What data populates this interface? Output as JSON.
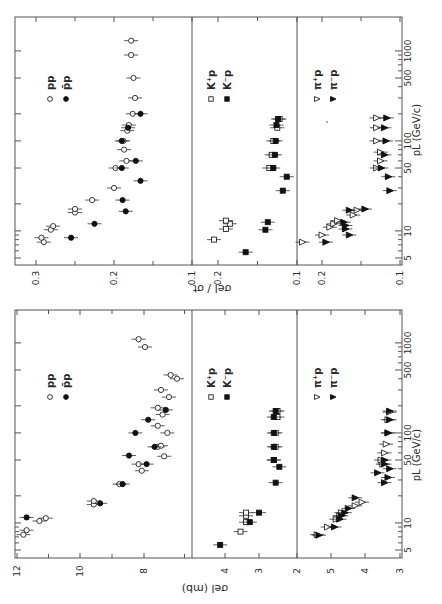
{
  "figure": {
    "orientation": "rotated 90 degrees counter-clockwise",
    "x_axis_label": "p_L (GeV/c)",
    "ticks_pL": [
      5,
      10,
      50,
      100,
      500,
      1000
    ]
  },
  "chart_data": [
    {
      "type": "scatter",
      "title": "Elastic cross section vs beam momentum",
      "xlabel": "p_L (GeV/c)",
      "ylabel": "σ_el (mb)",
      "xscale": "log",
      "xlim": [
        4.5,
        2000
      ],
      "panels": [
        {
          "name": "pp",
          "ylim": [
            6.5,
            12
          ],
          "yticks": [
            8,
            10,
            12
          ],
          "series": [
            {
              "name": "pp",
              "marker": "open-circle",
              "points": [
                [
                  7.4,
                  11.8
                ],
                [
                  8.3,
                  11.7
                ],
                [
                  10.5,
                  11.3
                ],
                [
                  11.3,
                  11.1
                ],
                [
                  16,
                  9.6
                ],
                [
                  17.5,
                  9.6
                ],
                [
                  27,
                  8.8
                ],
                [
                  38,
                  8.1
                ],
                [
                  45,
                  8.2
                ],
                [
                  55,
                  7.4
                ],
                [
                  70,
                  7.6
                ],
                [
                  72,
                  7.5
                ],
                [
                  100,
                  7.3
                ],
                [
                  120,
                  7.6
                ],
                [
                  160,
                  7.45
                ],
                [
                  190,
                  7.6
                ],
                [
                  250,
                  7.25
                ],
                [
                  300,
                  7.5
                ],
                [
                  400,
                  7.0
                ],
                [
                  440,
                  7.2
                ],
                [
                  900,
                  8.0
                ],
                [
                  1100,
                  8.2
                ]
              ]
            },
            {
              "name": "p̄p",
              "marker": "filled-circle",
              "points": [
                [
                  11.5,
                  11.7
                ],
                [
                  16.5,
                  9.4
                ],
                [
                  27,
                  8.7
                ],
                [
                  45,
                  7.95
                ],
                [
                  56,
                  8.5
                ],
                [
                  70,
                  7.7
                ],
                [
                  100,
                  8.3
                ],
                [
                  140,
                  7.9
                ],
                [
                  180,
                  7.35
                ]
              ]
            }
          ],
          "legend": [
            "pp",
            "p̄p"
          ]
        },
        {
          "name": "K p",
          "ylim": [
            2,
            4.6
          ],
          "yticks": [
            2,
            3,
            4
          ],
          "series": [
            {
              "name": "K+p",
              "marker": "open-square",
              "points": [
                [
                  8,
                  3.5
                ],
                [
                  10.2,
                  3.35
                ],
                [
                  12,
                  3.35
                ],
                [
                  13,
                  3.35
                ],
                [
                  50,
                  2.6
                ],
                [
                  70,
                  2.55
                ],
                [
                  100,
                  2.55
                ],
                [
                  150,
                  2.5
                ],
                [
                  175,
                  2.5
                ]
              ]
            },
            {
              "name": "K-p",
              "marker": "filled-square",
              "points": [
                [
                  5.7,
                  4.05
                ],
                [
                  10.2,
                  3.25
                ],
                [
                  13,
                  3.0
                ],
                [
                  28,
                  2.55
                ],
                [
                  42,
                  2.45
                ],
                [
                  50,
                  2.6
                ],
                [
                  70,
                  2.6
                ],
                [
                  100,
                  2.6
                ],
                [
                  150,
                  2.6
                ],
                [
                  175,
                  2.55
                ]
              ]
            }
          ],
          "legend": [
            "K+p",
            "K-p"
          ]
        },
        {
          "name": "π p",
          "ylim": [
            3,
            5.6
          ],
          "yticks": [
            3,
            4,
            5
          ],
          "series": [
            {
              "name": "π+p",
              "marker": "open-triangle",
              "points": [
                [
                  7.4,
                  5.4
                ],
                [
                  9,
                  5.1
                ],
                [
                  11,
                  4.85
                ],
                [
                  12,
                  4.75
                ],
                [
                  13,
                  4.7
                ],
                [
                  15.5,
                  4.3
                ],
                [
                  17,
                  4.1
                ],
                [
                  45,
                  3.5
                ],
                [
                  50,
                  3.55
                ],
                [
                  60,
                  3.45
                ],
                [
                  75,
                  3.4
                ],
                [
                  100,
                  3.35
                ],
                [
                  140,
                  3.35
                ],
                [
                  170,
                  3.3
                ]
              ]
            },
            {
              "name": "π-p",
              "marker": "filled-triangle",
              "points": [
                [
                  7.3,
                  5.35
                ],
                [
                  9,
                  4.9
                ],
                [
                  11,
                  4.75
                ],
                [
                  12,
                  4.7
                ],
                [
                  13,
                  4.6
                ],
                [
                  14.5,
                  4.5
                ],
                [
                  19,
                  4.3
                ],
                [
                  28,
                  3.45
                ],
                [
                  32,
                  3.35
                ],
                [
                  36,
                  3.65
                ],
                [
                  40,
                  3.3
                ],
                [
                  45,
                  3.45
                ],
                [
                  50,
                  3.45
                ],
                [
                  100,
                  3.35
                ],
                [
                  140,
                  3.3
                ],
                [
                  175,
                  3.3
                ]
              ]
            }
          ],
          "legend": [
            "π+p",
            "π-p"
          ]
        }
      ]
    },
    {
      "type": "scatter",
      "title": "Ratio of elastic to total cross section vs beam momentum",
      "xlabel": "p_L (GeV/c)",
      "ylabel": "σ_el / σ_t",
      "xscale": "log",
      "xlim": [
        4.5,
        2000
      ],
      "panels": [
        {
          "name": "pp",
          "ylim": [
            0.1,
            0.31
          ],
          "yticks": [
            0.1,
            0.2,
            0.3
          ],
          "series": [
            {
              "name": "pp",
              "marker": "open-circle",
              "points": [
                [
                  7.5,
                  0.29
                ],
                [
                  8.4,
                  0.293
                ],
                [
                  10.3,
                  0.281
                ],
                [
                  11.3,
                  0.278
                ],
                [
                  16,
                  0.25
                ],
                [
                  17.5,
                  0.25
                ],
                [
                  22,
                  0.228
                ],
                [
                  30,
                  0.2
                ],
                [
                  50,
                  0.198
                ],
                [
                  60,
                  0.184
                ],
                [
                  80,
                  0.187
                ],
                [
                  100,
                  0.188
                ],
                [
                  130,
                  0.183
                ],
                [
                  150,
                  0.181
                ],
                [
                  200,
                  0.176
                ],
                [
                  300,
                  0.173
                ],
                [
                  500,
                  0.175
                ],
                [
                  900,
                  0.178
                ],
                [
                  1300,
                  0.178
                ]
              ]
            },
            {
              "name": "p̄p",
              "marker": "filled-circle",
              "points": [
                [
                  8.4,
                  0.255
                ],
                [
                  12,
                  0.225
                ],
                [
                  16.5,
                  0.185
                ],
                [
                  22,
                  0.189
                ],
                [
                  36,
                  0.166
                ],
                [
                  50,
                  0.19
                ],
                [
                  60,
                  0.172
                ],
                [
                  100,
                  0.19
                ],
                [
                  140,
                  0.182
                ],
                [
                  200,
                  0.166
                ]
              ]
            }
          ],
          "legend": [
            "pp",
            "p̄p"
          ]
        },
        {
          "name": "K p",
          "ylim": [
            0.1,
            0.21
          ],
          "yticks": [
            0.1,
            0.2
          ],
          "series": [
            {
              "name": "K+p",
              "marker": "open-square",
              "points": [
                [
                  8,
                  0.205
                ],
                [
                  10.5,
                  0.19
                ],
                [
                  12,
                  0.185
                ],
                [
                  13,
                  0.19
                ],
                [
                  50,
                  0.135
                ],
                [
                  70,
                  0.132
                ],
                [
                  100,
                  0.13
                ],
                [
                  140,
                  0.125
                ],
                [
                  175,
                  0.122
                ]
              ]
            },
            {
              "name": "K-p",
              "marker": "filled-square",
              "points": [
                [
                  5.8,
                  0.165
                ],
                [
                  10.3,
                  0.14
                ],
                [
                  12.5,
                  0.137
                ],
                [
                  28,
                  0.118
                ],
                [
                  40,
                  0.113
                ],
                [
                  50,
                  0.13
                ],
                [
                  70,
                  0.128
                ],
                [
                  100,
                  0.127
                ],
                [
                  150,
                  0.126
                ],
                [
                  175,
                  0.124
                ]
              ]
            }
          ],
          "legend": [
            "K+p",
            "K-p"
          ]
        },
        {
          "name": "π p",
          "ylim": [
            0.1,
            0.23
          ],
          "yticks": [
            0.1,
            0.2
          ],
          "series": [
            {
              "name": "π+p",
              "marker": "open-triangle",
              "points": [
                [
                  7.5,
                  0.225
                ],
                [
                  9,
                  0.2
                ],
                [
                  11,
                  0.19
                ],
                [
                  12,
                  0.185
                ],
                [
                  13,
                  0.18
                ],
                [
                  15,
                  0.16
                ],
                [
                  17,
                  0.155
                ],
                [
                  50,
                  0.13
                ],
                [
                  60,
                  0.125
                ],
                [
                  75,
                  0.125
                ],
                [
                  100,
                  0.13
                ],
                [
                  140,
                  0.13
                ],
                [
                  180,
                  0.13
                ]
              ]
            },
            {
              "name": "π-p",
              "marker": "filled-triangle",
              "points": [
                [
                  7.5,
                  0.195
                ],
                [
                  9,
                  0.165
                ],
                [
                  10.5,
                  0.17
                ],
                [
                  11.5,
                  0.17
                ],
                [
                  12.5,
                  0.172
                ],
                [
                  17,
                  0.165
                ],
                [
                  17.5,
                  0.145
                ],
                [
                  28,
                  0.113
                ],
                [
                  40,
                  0.115
                ],
                [
                  50,
                  0.124
                ],
                [
                  70,
                  0.12
                ],
                [
                  100,
                  0.118
                ],
                [
                  140,
                  0.12
                ],
                [
                  180,
                  0.117
                ]
              ]
            }
          ],
          "legend": [
            "π+p",
            "π-p"
          ]
        }
      ]
    }
  ],
  "labels": {
    "top_axis_title": "σel / σt",
    "bottom_axis_title": "σel   (mb)",
    "pl_label": "pL  (GeV/c)",
    "pl_ticks": [
      "5",
      "10",
      "50",
      "100",
      "500",
      "1000"
    ],
    "top_value_ticks": [
      {
        "text": "0.3",
        "x": 36
      },
      {
        "text": "0.2",
        "x": 114
      },
      {
        "text": "0.1",
        "x": 192
      },
      {
        "text": "0.2",
        "x": 218
      },
      {
        "text": "0.1",
        "x": 297
      },
      {
        "text": "0.2",
        "x": 322
      },
      {
        "text": "0.1",
        "x": 400
      }
    ],
    "bottom_value_ticks": [
      {
        "text": "12",
        "x": 17
      },
      {
        "text": "10",
        "x": 80
      },
      {
        "text": "8",
        "x": 144
      },
      {
        "text": "4",
        "x": 225
      },
      {
        "text": "3",
        "x": 259
      },
      {
        "text": "2",
        "x": 297
      },
      {
        "text": "5",
        "x": 331
      },
      {
        "text": "4",
        "x": 365
      },
      {
        "text": "3",
        "x": 400
      }
    ],
    "legends": {
      "pp": [
        "pp",
        "p̄p"
      ],
      "kp": [
        "K⁺p",
        "K⁻p"
      ],
      "pip": [
        "π⁺p",
        "π⁻p"
      ]
    }
  }
}
